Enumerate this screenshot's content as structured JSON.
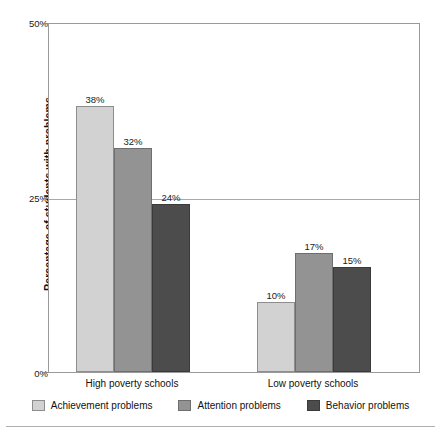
{
  "chart_data": {
    "type": "bar",
    "title": "",
    "xlabel": "",
    "ylabel": "Percentage of students with problems",
    "categories": [
      "High poverty schools",
      "Low poverty schools"
    ],
    "series": [
      {
        "name": "Achievement problems",
        "values": [
          38,
          32
        ],
        "color": "#d2d2d2"
      },
      {
        "name": "Attention problems",
        "values": [
          32,
          17
        ],
        "color": "#939393"
      },
      {
        "name": "Behavior problems",
        "values": [
          24,
          15
        ],
        "color": "#4c4c4c"
      }
    ],
    "value_labels": [
      [
        "38%",
        "32%",
        "24%"
      ],
      [
        "10%",
        "17%",
        "15%"
      ]
    ],
    "data_matrix": [
      [
        38,
        32,
        24
      ],
      [
        10,
        17,
        15
      ]
    ],
    "ylim": [
      0,
      50
    ],
    "yticks": [
      0,
      25,
      50
    ],
    "ytick_labels": [
      "0%",
      "25%",
      "50%"
    ],
    "grid": "horizontal-at-25",
    "legend_position": "bottom"
  },
  "axis": {
    "y_title": "Percentage of students with problems",
    "y_ticks": [
      {
        "label": "50%",
        "value": 50
      },
      {
        "label": "25%",
        "value": 25
      },
      {
        "label": "0%",
        "value": 0
      }
    ]
  },
  "groups": [
    {
      "label": "High poverty schools",
      "bars": [
        {
          "series": "Achievement problems",
          "value": 38,
          "label": "38%"
        },
        {
          "series": "Attention problems",
          "value": 32,
          "label": "32%"
        },
        {
          "series": "Behavior problems",
          "value": 24,
          "label": "24%"
        }
      ]
    },
    {
      "label": "Low poverty schools",
      "bars": [
        {
          "series": "Achievement problems",
          "value": 10,
          "label": "10%"
        },
        {
          "series": "Attention problems",
          "value": 17,
          "label": "17%"
        },
        {
          "series": "Behavior problems",
          "value": 15,
          "label": "15%"
        }
      ]
    }
  ],
  "legend": {
    "items": [
      {
        "label": "Achievement problems",
        "color": "#d2d2d2"
      },
      {
        "label": "Attention problems",
        "color": "#939393"
      },
      {
        "label": "Behavior problems",
        "color": "#4c4c4c"
      }
    ]
  }
}
